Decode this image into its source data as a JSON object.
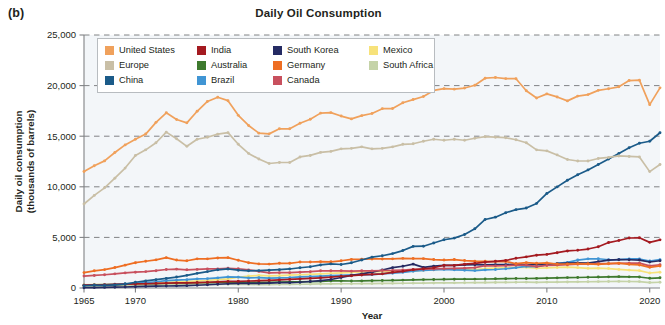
{
  "figure": {
    "panel_label": "(b)",
    "title": "Daily Oil Consumption"
  },
  "axes": {
    "x_title": "Year",
    "y_title_line1": "Daily oil consumption",
    "y_title_line2": "(thousands of barrels)",
    "x_ticks": [
      "1965",
      "1970",
      "1980",
      "1990",
      "2000",
      "2010",
      "2020"
    ],
    "y_ticks": [
      "0",
      "5,000",
      "10,000",
      "15,000",
      "20,000",
      "25,000"
    ]
  },
  "legend": {
    "columns": 4,
    "items": [
      {
        "label": "United States",
        "color": "#F0A15C"
      },
      {
        "label": "India",
        "color": "#A41A20"
      },
      {
        "label": "South Korea",
        "color": "#252B63"
      },
      {
        "label": "Mexico",
        "color": "#F7E27A"
      },
      {
        "label": "Europe",
        "color": "#C9BFA6"
      },
      {
        "label": "Australia",
        "color": "#3E7A2E"
      },
      {
        "label": "Germany",
        "color": "#EE6E23"
      },
      {
        "label": "South Africa",
        "color": "#C5D3A8"
      },
      {
        "label": "China",
        "color": "#1B5B89"
      },
      {
        "label": "Brazil",
        "color": "#4095D4"
      },
      {
        "label": "Canada",
        "color": "#C8505E"
      }
    ]
  },
  "chart_data": {
    "type": "line",
    "title": "Daily Oil Consumption",
    "xlabel": "Year",
    "ylabel": "Daily oil consumption (thousands of barrels)",
    "xlim": [
      1965,
      2021
    ],
    "ylim": [
      0,
      25000
    ],
    "grid": true,
    "legend_position": "upper-left-inside",
    "x": [
      1965,
      1966,
      1967,
      1968,
      1969,
      1970,
      1971,
      1972,
      1973,
      1974,
      1975,
      1976,
      1977,
      1978,
      1979,
      1980,
      1981,
      1982,
      1983,
      1984,
      1985,
      1986,
      1987,
      1988,
      1989,
      1990,
      1991,
      1992,
      1993,
      1994,
      1995,
      1996,
      1997,
      1998,
      1999,
      2000,
      2001,
      2002,
      2003,
      2004,
      2005,
      2006,
      2007,
      2008,
      2009,
      2010,
      2011,
      2012,
      2013,
      2014,
      2015,
      2016,
      2017,
      2018,
      2019,
      2020,
      2021
    ],
    "series": [
      {
        "name": "United States",
        "color": "#F0A15C",
        "values": [
          11510,
          12080,
          12560,
          13390,
          14140,
          14700,
          15210,
          16370,
          17310,
          16650,
          16320,
          17460,
          18430,
          18850,
          18510,
          17060,
          16060,
          15300,
          15230,
          15730,
          15730,
          16280,
          16670,
          17280,
          17330,
          16990,
          16710,
          17030,
          17240,
          17720,
          17730,
          18310,
          18620,
          18920,
          19520,
          19700,
          19650,
          19760,
          20030,
          20730,
          20800,
          20690,
          20680,
          19490,
          18770,
          19180,
          18880,
          18490,
          18960,
          19110,
          19530,
          19690,
          19880,
          20500,
          20540,
          18120,
          19780
        ]
      },
      {
        "name": "Europe",
        "color": "#C9BFA6",
        "values": [
          8300,
          9150,
          9900,
          10850,
          11850,
          13100,
          13650,
          14350,
          15400,
          14750,
          14000,
          14700,
          14900,
          15200,
          15350,
          14200,
          13300,
          12750,
          12300,
          12400,
          12400,
          12950,
          13100,
          13400,
          13500,
          13750,
          13800,
          13950,
          13750,
          13800,
          13950,
          14200,
          14250,
          14500,
          14700,
          14600,
          14700,
          14600,
          14800,
          14950,
          14900,
          14850,
          14650,
          14350,
          13650,
          13550,
          13150,
          12700,
          12550,
          12550,
          12800,
          12900,
          13050,
          13000,
          12950,
          11500,
          12200
        ]
      },
      {
        "name": "China",
        "color": "#1B5B89",
        "values": [
          220,
          280,
          250,
          310,
          390,
          570,
          700,
          820,
          950,
          1080,
          1250,
          1450,
          1620,
          1800,
          1880,
          1760,
          1700,
          1720,
          1760,
          1810,
          1880,
          2000,
          2100,
          2280,
          2380,
          2320,
          2490,
          2770,
          3050,
          3190,
          3400,
          3700,
          4110,
          4130,
          4450,
          4770,
          4930,
          5290,
          5850,
          6770,
          7000,
          7440,
          7740,
          7900,
          8360,
          9340,
          9990,
          10640,
          11190,
          11670,
          12200,
          12740,
          13300,
          13860,
          14300,
          14500,
          15340
        ]
      },
      {
        "name": "India",
        "color": "#A41A20",
        "values": [
          280,
          300,
          320,
          350,
          380,
          400,
          420,
          450,
          480,
          500,
          510,
          540,
          570,
          610,
          650,
          660,
          690,
          720,
          760,
          800,
          850,
          900,
          950,
          1010,
          1070,
          1160,
          1210,
          1290,
          1350,
          1400,
          1550,
          1650,
          1800,
          1900,
          2000,
          2250,
          2240,
          2350,
          2440,
          2550,
          2640,
          2720,
          2940,
          3080,
          3240,
          3320,
          3490,
          3660,
          3730,
          3850,
          4080,
          4490,
          4690,
          4940,
          4960,
          4510,
          4760
        ]
      },
      {
        "name": "Germany",
        "color": "#EE6E23",
        "values": [
          1520,
          1700,
          1820,
          2020,
          2260,
          2500,
          2640,
          2780,
          3000,
          2760,
          2690,
          2880,
          2880,
          2970,
          3000,
          2740,
          2500,
          2380,
          2360,
          2440,
          2440,
          2570,
          2570,
          2600,
          2590,
          2690,
          2820,
          2840,
          2870,
          2870,
          2880,
          2930,
          2910,
          2900,
          2810,
          2760,
          2810,
          2710,
          2660,
          2640,
          2610,
          2620,
          2400,
          2510,
          2440,
          2480,
          2370,
          2370,
          2410,
          2390,
          2340,
          2400,
          2450,
          2340,
          2280,
          2040,
          2180
        ]
      },
      {
        "name": "Canada",
        "color": "#C8505E",
        "values": [
          1180,
          1240,
          1310,
          1400,
          1490,
          1560,
          1620,
          1710,
          1830,
          1870,
          1800,
          1840,
          1880,
          1880,
          1950,
          1900,
          1790,
          1640,
          1500,
          1510,
          1510,
          1560,
          1610,
          1700,
          1700,
          1700,
          1660,
          1700,
          1690,
          1730,
          1740,
          1780,
          1840,
          1860,
          1880,
          1920,
          1930,
          1960,
          2010,
          2200,
          2190,
          2200,
          2260,
          2260,
          2120,
          2230,
          2270,
          2300,
          2350,
          2370,
          2400,
          2410,
          2430,
          2450,
          2460,
          2190,
          2300
        ]
      },
      {
        "name": "South Korea",
        "color": "#252B63",
        "values": [
          30,
          40,
          60,
          80,
          100,
          130,
          160,
          180,
          200,
          210,
          230,
          270,
          320,
          370,
          420,
          450,
          450,
          460,
          490,
          530,
          530,
          570,
          640,
          730,
          840,
          1040,
          1240,
          1400,
          1560,
          1780,
          2010,
          2150,
          2360,
          2040,
          2160,
          2230,
          2230,
          2290,
          2300,
          2290,
          2310,
          2310,
          2370,
          2290,
          2340,
          2370,
          2400,
          2460,
          2480,
          2460,
          2610,
          2750,
          2800,
          2790,
          2760,
          2570,
          2690
        ]
      },
      {
        "name": "Brazil",
        "color": "#4095D4",
        "values": [
          280,
          310,
          330,
          370,
          420,
          470,
          540,
          620,
          720,
          780,
          820,
          900,
          930,
          1000,
          1090,
          1070,
          1000,
          1020,
          970,
          1000,
          1030,
          1090,
          1130,
          1170,
          1220,
          1250,
          1290,
          1300,
          1320,
          1400,
          1460,
          1550,
          1660,
          1750,
          1800,
          1840,
          1800,
          1760,
          1720,
          1790,
          1830,
          1900,
          2010,
          2140,
          2110,
          2300,
          2430,
          2530,
          2760,
          2880,
          2890,
          2790,
          2810,
          2880,
          2870,
          2670,
          2800
        ]
      },
      {
        "name": "Mexico",
        "color": "#F7E27A",
        "values": [
          310,
          330,
          350,
          380,
          410,
          440,
          460,
          500,
          550,
          600,
          650,
          690,
          740,
          820,
          900,
          1060,
          1180,
          1240,
          1200,
          1230,
          1280,
          1310,
          1350,
          1400,
          1450,
          1490,
          1530,
          1580,
          1600,
          1630,
          1570,
          1610,
          1680,
          1760,
          1810,
          1880,
          1870,
          1840,
          1820,
          1920,
          1970,
          1990,
          2030,
          2040,
          1950,
          1990,
          2030,
          2070,
          2010,
          1940,
          1960,
          1920,
          1840,
          1770,
          1720,
          1480,
          1560
        ]
      },
      {
        "name": "Australia",
        "color": "#3E7A2E",
        "values": [
          270,
          290,
          310,
          340,
          370,
          400,
          420,
          440,
          480,
          500,
          510,
          530,
          540,
          560,
          590,
          580,
          570,
          570,
          560,
          580,
          600,
          620,
          630,
          660,
          700,
          700,
          690,
          700,
          720,
          740,
          760,
          780,
          810,
          830,
          840,
          860,
          870,
          880,
          880,
          890,
          910,
          920,
          940,
          940,
          950,
          970,
          1000,
          1030,
          1040,
          1060,
          1080,
          1100,
          1120,
          1100,
          1090,
          960,
          1010
        ]
      },
      {
        "name": "South Africa",
        "color": "#C5D3A8",
        "values": [
          170,
          180,
          190,
          210,
          230,
          250,
          260,
          280,
          300,
          320,
          330,
          340,
          350,
          360,
          370,
          360,
          350,
          340,
          340,
          350,
          360,
          370,
          380,
          400,
          410,
          420,
          420,
          430,
          440,
          450,
          460,
          470,
          480,
          490,
          500,
          510,
          510,
          520,
          530,
          540,
          550,
          560,
          570,
          580,
          560,
          580,
          590,
          600,
          610,
          620,
          630,
          640,
          650,
          640,
          630,
          540,
          570
        ]
      }
    ]
  }
}
